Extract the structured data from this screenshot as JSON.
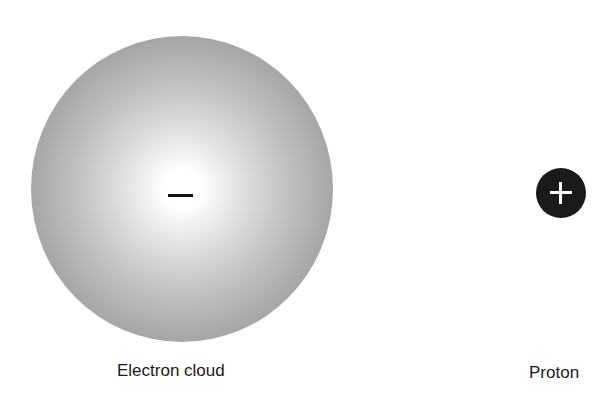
{
  "diagram": {
    "electron_cloud": {
      "label": "Electron cloud",
      "charge_symbol": "minus",
      "fill": "radial-gradient white-center to gray-edge"
    },
    "proton": {
      "label": "Proton",
      "charge_symbol": "plus",
      "fill_color": "#1a1a1a",
      "symbol_color": "#ffffff"
    }
  }
}
